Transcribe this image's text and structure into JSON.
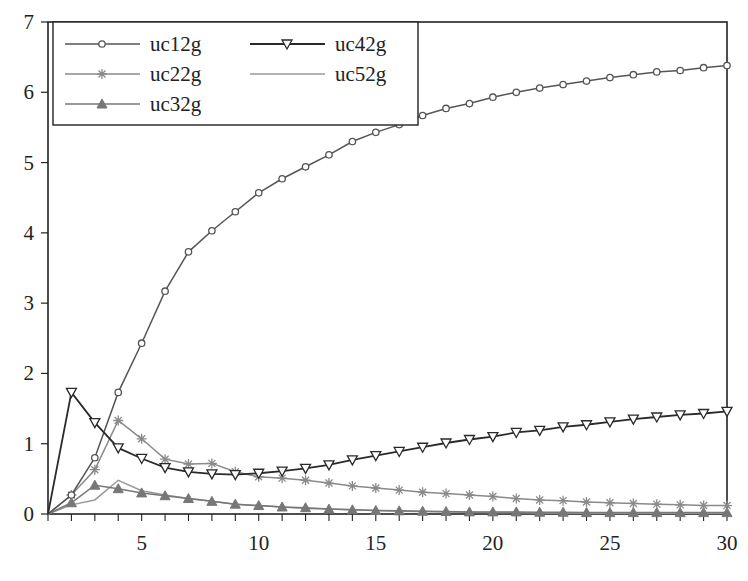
{
  "chart_data": {
    "type": "line",
    "title": "",
    "xlabel": "",
    "ylabel": "",
    "xlim": [
      1,
      30
    ],
    "ylim": [
      0,
      7
    ],
    "grid": false,
    "legend_position": "upper-left",
    "x_ticks": [
      5,
      10,
      15,
      20,
      25,
      30
    ],
    "y_ticks": [
      0,
      1,
      2,
      3,
      4,
      5,
      6,
      7
    ],
    "x": [
      1,
      2,
      3,
      4,
      5,
      6,
      7,
      8,
      9,
      10,
      11,
      12,
      13,
      14,
      15,
      16,
      17,
      18,
      19,
      20,
      21,
      22,
      23,
      24,
      25,
      26,
      27,
      28,
      29,
      30
    ],
    "series": [
      {
        "name": "uc12g",
        "marker": "circle",
        "color": "#555555",
        "values": [
          0,
          0.27,
          0.8,
          1.73,
          2.43,
          3.17,
          3.73,
          4.03,
          4.3,
          4.57,
          4.77,
          4.94,
          5.11,
          5.3,
          5.43,
          5.54,
          5.67,
          5.77,
          5.84,
          5.93,
          6.0,
          6.06,
          6.11,
          6.16,
          6.21,
          6.25,
          6.29,
          6.31,
          6.35,
          6.38
        ]
      },
      {
        "name": "uc22g",
        "marker": "star",
        "color": "#8a8a8a",
        "values": [
          0,
          0.27,
          0.63,
          1.33,
          1.07,
          0.78,
          0.71,
          0.72,
          0.6,
          0.53,
          0.51,
          0.48,
          0.44,
          0.4,
          0.37,
          0.34,
          0.31,
          0.29,
          0.27,
          0.25,
          0.22,
          0.2,
          0.19,
          0.17,
          0.16,
          0.15,
          0.14,
          0.13,
          0.12,
          0.12
        ]
      },
      {
        "name": "uc32g",
        "marker": "triangle-up",
        "color": "#777777",
        "values": [
          0,
          0.16,
          0.41,
          0.36,
          0.3,
          0.26,
          0.22,
          0.18,
          0.14,
          0.12,
          0.1,
          0.09,
          0.07,
          0.06,
          0.05,
          0.045,
          0.04,
          0.035,
          0.03,
          0.03,
          0.03,
          0.025,
          0.025,
          0.02,
          0.02,
          0.02,
          0.02,
          0.02,
          0.02,
          0.02
        ]
      },
      {
        "name": "uc42g",
        "marker": "triangle-down",
        "color": "#2a2a2a",
        "values": [
          0,
          1.73,
          1.3,
          0.94,
          0.79,
          0.66,
          0.6,
          0.57,
          0.56,
          0.58,
          0.61,
          0.65,
          0.7,
          0.77,
          0.83,
          0.89,
          0.95,
          1.01,
          1.06,
          1.1,
          1.16,
          1.19,
          1.24,
          1.27,
          1.31,
          1.35,
          1.38,
          1.41,
          1.43,
          1.46
        ]
      },
      {
        "name": "uc52g",
        "marker": "none",
        "color": "#999999",
        "values": [
          0,
          0.13,
          0.2,
          0.48,
          0.33,
          0.27,
          0.22,
          0.18,
          0.14,
          0.12,
          0.1,
          0.08,
          0.07,
          0.06,
          0.05,
          0.04,
          0.035,
          0.03,
          0.025,
          0.02,
          0.02,
          0.015,
          0.015,
          0.01,
          0.01,
          0.01,
          0.01,
          0.01,
          0.01,
          0.01
        ]
      }
    ]
  },
  "legend": {
    "items": [
      {
        "label": "uc12g"
      },
      {
        "label": "uc22g"
      },
      {
        "label": "uc32g"
      },
      {
        "label": "uc42g"
      },
      {
        "label": "uc52g"
      }
    ]
  }
}
